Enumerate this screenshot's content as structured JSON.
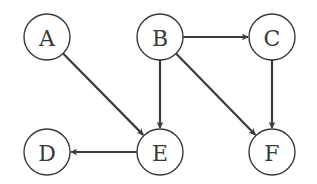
{
  "diagram": {
    "type": "directed-graph",
    "nodes": [
      {
        "id": "A",
        "label": "A",
        "x": 47,
        "y": 37
      },
      {
        "id": "B",
        "label": "B",
        "x": 160,
        "y": 37
      },
      {
        "id": "C",
        "label": "C",
        "x": 272,
        "y": 37
      },
      {
        "id": "D",
        "label": "D",
        "x": 47,
        "y": 152
      },
      {
        "id": "E",
        "label": "E",
        "x": 160,
        "y": 152
      },
      {
        "id": "F",
        "label": "F",
        "x": 272,
        "y": 152
      }
    ],
    "edges": [
      {
        "from": "A",
        "to": "E"
      },
      {
        "from": "B",
        "to": "C"
      },
      {
        "from": "B",
        "to": "E"
      },
      {
        "from": "B",
        "to": "F"
      },
      {
        "from": "C",
        "to": "F"
      },
      {
        "from": "E",
        "to": "D"
      }
    ],
    "colors": {
      "stroke": "#3a3a3a",
      "background": "#ffffff"
    }
  }
}
